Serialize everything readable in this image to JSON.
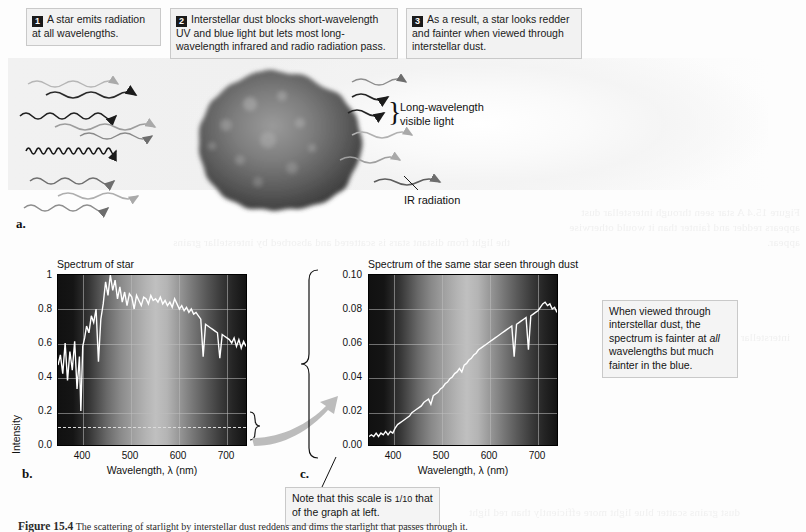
{
  "figure": {
    "panel_a_letter": "a.",
    "panel_b_letter": "b.",
    "panel_c_letter": "c.",
    "caption_number": "Figure 15.4",
    "caption_text": "The scattering of starlight by interstellar dust reddens and dims the starlight that passes through it."
  },
  "steps": [
    {
      "num": "1",
      "text": "A star emits radiation at all wavelengths."
    },
    {
      "num": "2",
      "text": "Interstellar dust blocks short-wavelength UV and blue light but lets most long-wavelength infrared and radio radiation pass."
    },
    {
      "num": "3",
      "text": "As a result, a star looks redder and fainter when viewed through interstellar dust."
    }
  ],
  "illustration": {
    "label_visible": "Long-wavelength visible light",
    "label_ir": "IR radiation",
    "brace_glyph": "}"
  },
  "notes": {
    "right_note_line1": "When viewed through",
    "right_note_line2": "interstellar dust, the",
    "right_note_line3": "spectrum is fainter at",
    "right_note_em": "all",
    "right_note_line4": " wavelengths but",
    "right_note_line5": "much fainter in the blue.",
    "scale_note_a": "Note that this scale is ",
    "scale_note_frac": "1/10",
    "scale_note_b": "that of the graph at left."
  },
  "chart_data": [
    {
      "id": "chart-b",
      "type": "line",
      "title": "Spectrum of star",
      "xlabel": "Wavelength, λ (nm)",
      "ylabel": "Intensity",
      "xlim": [
        350,
        745
      ],
      "ylim": [
        0,
        1
      ],
      "xticks": [
        400,
        500,
        600,
        700
      ],
      "yticks": [
        "0.0",
        "0.2",
        "0.4",
        "0.6",
        "0.8",
        "1"
      ],
      "ytick_values": [
        0.0,
        0.2,
        0.4,
        0.6,
        0.8,
        1.0
      ],
      "grid": true,
      "dashed_reference_level": 0.115,
      "x": [
        350,
        355,
        360,
        365,
        370,
        375,
        380,
        385,
        390,
        395,
        398,
        402,
        406,
        410,
        415,
        420,
        425,
        430,
        435,
        440,
        445,
        450,
        455,
        460,
        465,
        470,
        475,
        480,
        485,
        490,
        495,
        500,
        505,
        510,
        515,
        520,
        525,
        530,
        535,
        540,
        545,
        550,
        555,
        560,
        565,
        570,
        575,
        580,
        585,
        590,
        595,
        600,
        605,
        610,
        615,
        620,
        625,
        630,
        635,
        640,
        645,
        650,
        655,
        660,
        665,
        670,
        675,
        680,
        685,
        690,
        695,
        700,
        705,
        710,
        715,
        720,
        725,
        730,
        735,
        740,
        745
      ],
      "y": [
        0.47,
        0.53,
        0.42,
        0.6,
        0.38,
        0.55,
        0.44,
        0.61,
        0.33,
        0.52,
        0.2,
        0.58,
        0.63,
        0.7,
        0.66,
        0.76,
        0.72,
        0.8,
        0.49,
        0.74,
        0.83,
        0.96,
        0.88,
        1.0,
        0.91,
        0.97,
        0.86,
        0.93,
        0.84,
        0.9,
        0.82,
        0.89,
        0.87,
        0.8,
        0.88,
        0.85,
        0.82,
        0.87,
        0.86,
        0.83,
        0.88,
        0.85,
        0.86,
        0.84,
        0.87,
        0.83,
        0.85,
        0.82,
        0.84,
        0.81,
        0.86,
        0.83,
        0.8,
        0.82,
        0.79,
        0.81,
        0.78,
        0.8,
        0.77,
        0.78,
        0.76,
        0.74,
        0.52,
        0.71,
        0.7,
        0.69,
        0.68,
        0.67,
        0.66,
        0.51,
        0.65,
        0.64,
        0.63,
        0.62,
        0.6,
        0.63,
        0.58,
        0.62,
        0.57,
        0.61,
        0.58
      ]
    },
    {
      "id": "chart-c",
      "type": "line",
      "title": "Spectrum of the same star seen through dust",
      "xlabel": "Wavelength, λ (nm)",
      "ylabel": "",
      "xlim": [
        350,
        745
      ],
      "ylim": [
        0,
        0.1
      ],
      "xticks": [
        400,
        500,
        600,
        700
      ],
      "yticks": [
        "0.00",
        "0.02",
        "0.04",
        "0.06",
        "0.08",
        "0.10"
      ],
      "ytick_values": [
        0.0,
        0.02,
        0.04,
        0.06,
        0.08,
        0.1
      ],
      "grid": true,
      "x": [
        350,
        355,
        360,
        365,
        370,
        375,
        380,
        385,
        390,
        395,
        400,
        405,
        410,
        415,
        420,
        425,
        430,
        435,
        440,
        445,
        450,
        455,
        460,
        465,
        470,
        475,
        480,
        485,
        490,
        495,
        500,
        505,
        510,
        515,
        520,
        525,
        530,
        535,
        540,
        545,
        550,
        555,
        560,
        565,
        570,
        575,
        580,
        585,
        590,
        595,
        600,
        605,
        610,
        615,
        620,
        625,
        630,
        635,
        640,
        645,
        650,
        655,
        660,
        665,
        670,
        675,
        680,
        685,
        690,
        695,
        700,
        705,
        710,
        715,
        720,
        725,
        730,
        735,
        740,
        745
      ],
      "y": [
        0.005,
        0.006,
        0.005,
        0.007,
        0.005,
        0.007,
        0.006,
        0.008,
        0.006,
        0.008,
        0.007,
        0.01,
        0.012,
        0.013,
        0.014,
        0.015,
        0.016,
        0.017,
        0.019,
        0.02,
        0.021,
        0.022,
        0.023,
        0.025,
        0.026,
        0.027,
        0.024,
        0.029,
        0.03,
        0.031,
        0.033,
        0.034,
        0.036,
        0.037,
        0.039,
        0.04,
        0.042,
        0.043,
        0.045,
        0.043,
        0.047,
        0.048,
        0.05,
        0.051,
        0.053,
        0.054,
        0.056,
        0.057,
        0.058,
        0.059,
        0.06,
        0.061,
        0.062,
        0.063,
        0.064,
        0.065,
        0.066,
        0.067,
        0.068,
        0.069,
        0.07,
        0.052,
        0.071,
        0.072,
        0.073,
        0.074,
        0.075,
        0.056,
        0.076,
        0.077,
        0.078,
        0.079,
        0.081,
        0.083,
        0.084,
        0.082,
        0.083,
        0.08,
        0.081,
        0.078
      ]
    }
  ]
}
